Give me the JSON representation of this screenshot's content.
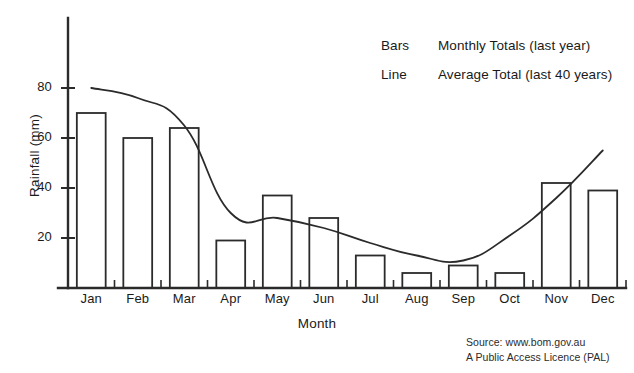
{
  "chart_data": {
    "type": "bar",
    "title": "",
    "subtitle": "",
    "xlabel": "Month",
    "ylabel": "Rainfall (mm)",
    "categories": [
      "Jan",
      "Feb",
      "Mar",
      "Apr",
      "May",
      "Jun",
      "Jul",
      "Aug",
      "Sep",
      "Oct",
      "Nov",
      "Dec"
    ],
    "values": [
      70,
      60,
      64,
      19,
      37,
      28,
      13,
      6,
      9,
      6,
      42,
      39
    ],
    "series": [
      {
        "name": "Monthly Totals (last year)",
        "type": "bar",
        "values": [
          70,
          60,
          64,
          19,
          37,
          28,
          13,
          6,
          9,
          6,
          42,
          39
        ]
      },
      {
        "name": "Average Total (last 40 years)",
        "type": "line",
        "values": [
          80,
          76,
          65,
          30,
          28,
          24,
          18,
          13,
          11,
          21,
          36,
          55
        ]
      }
    ],
    "ylim": [
      0,
      108
    ],
    "yticks": [
      20,
      40,
      60,
      80
    ],
    "ytick_labels": [
      "20",
      "40",
      "60",
      "80"
    ],
    "grid": false,
    "legend_position": "top-right"
  },
  "axes": {
    "y_title": "Rainfall (mm)",
    "x_title": "Month",
    "y_tick_labels": [
      "20",
      "40",
      "60",
      "80"
    ],
    "x_tick_labels": [
      "Jan",
      "Feb",
      "Mar",
      "Apr",
      "May",
      "Jun",
      "Jul",
      "Aug",
      "Sep",
      "Oct",
      "Nov",
      "Dec"
    ]
  },
  "legend": {
    "rows": [
      {
        "key": "Bars",
        "description": "Monthly Totals (last year)"
      },
      {
        "key": "Line",
        "description": "Average Total (last 40 years)"
      }
    ]
  },
  "source": {
    "line1": "Source: www.bom.gov.au",
    "line2": "A Public Access Licence (PAL)"
  },
  "style": {
    "ink": "#2b2b2b",
    "background": "#ffffff"
  }
}
